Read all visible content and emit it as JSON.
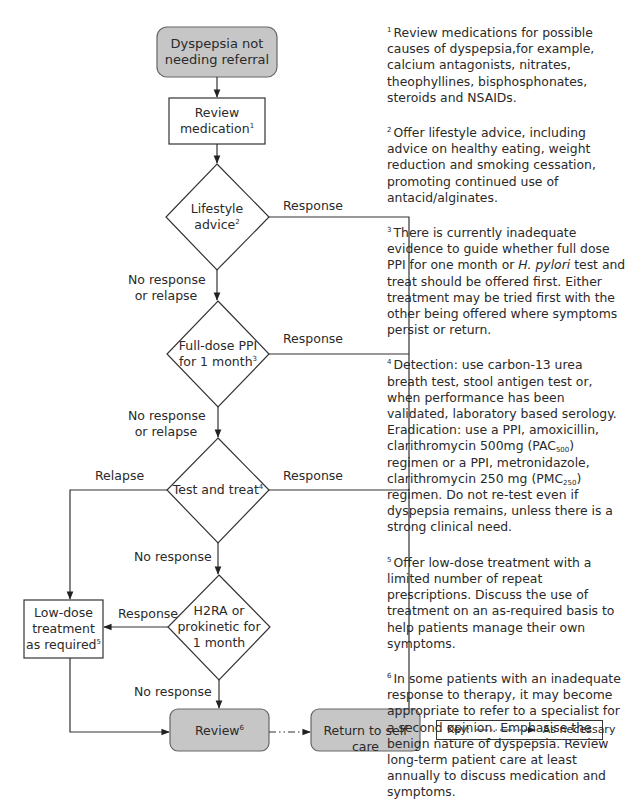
{
  "nodes": {
    "start": {
      "line1": "Dyspepsia not",
      "line2": "needing referral"
    },
    "review_medication": {
      "line1": "Review",
      "line2": "medication",
      "note": "1"
    },
    "lifestyle": {
      "line1": "Lifestyle",
      "line2": "advice",
      "note": "2"
    },
    "ppi": {
      "line1": "Full-dose PPI",
      "line2": "for 1 month",
      "note": "3"
    },
    "test_treat": {
      "line1": "Test and treat",
      "note": "4"
    },
    "h2ra": {
      "line1": "H2RA or",
      "line2": "prokinetic for",
      "line3": "1 month"
    },
    "low_dose": {
      "line1": "Low-dose",
      "line2": "treatment",
      "line3": "as required",
      "note": "5"
    },
    "review": {
      "line1": "Review",
      "note": "6"
    },
    "self_care": {
      "line1": "Return to self care"
    }
  },
  "edge_labels": {
    "lifestyle_response": "Response",
    "lifestyle_no_response": {
      "line1": "No response",
      "line2": "or relapse"
    },
    "ppi_response": "Response",
    "ppi_no_response": {
      "line1": "No response",
      "line2": "or relapse"
    },
    "test_relapse": "Relapse",
    "test_response": "Response",
    "test_no_response": "No response",
    "h2ra_response": "Response",
    "h2ra_no_response": "No response"
  },
  "notes": [
    {
      "num": "1",
      "text": "Review medications for possible causes of dyspepsia,for example, calcium antagonists, nitrates, theophyllines, bisphosphonates, steroids and NSAIDs."
    },
    {
      "num": "2",
      "text": "Offer lifestyle advice, including advice on healthy eating, weight reduction and smoking cessation, promoting continued use of antacid/alginates."
    },
    {
      "num": "3",
      "pre": "There is currently inadequate evidence to guide whether full dose PPI for one month or ",
      "italic": "H. pylori",
      "post": " test and treat should be offered first. Either treatment may be tried first with the other being offered where symptoms persist or return."
    },
    {
      "num": "4",
      "detection": "Detection: use carbon-13 urea breath test, stool antigen test or, when performance has been validated, laboratory based serology.",
      "erad_a": "Eradication: use a PPI, amoxicillin, clarithromycin 500mg (PAC",
      "sub_a": "500",
      "erad_b": ") regimen or a PPI, metronidazole, clarithromycin 250 mg (PMC",
      "sub_b": "250",
      "erad_c": ") regimen. Do not re-test even if dyspepsia remains, unless there is a strong clinical need."
    },
    {
      "num": "5",
      "text": "Offer low-dose treatment with a limited number of repeat prescriptions. Discuss the use of treatment on an as-required basis to help patients manage their own symptoms."
    },
    {
      "num": "6",
      "text": "In some patients with an inadequate response to therapy, it may become appropriate to refer to a specialist for a second opinion. Emphasise the benign nature of dyspepsia. Review long-term patient care at least annually to discuss medication and symptoms."
    }
  ],
  "key": {
    "label": "Key:",
    "meaning": "As necessary"
  },
  "colors": {
    "terminal_fill": "#c6c6c6",
    "stroke": "#333333",
    "text": "#2a2a2a"
  }
}
